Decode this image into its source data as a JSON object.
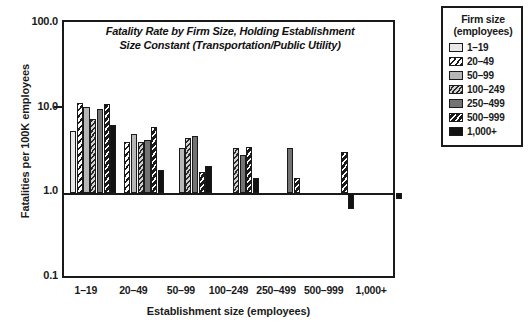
{
  "chart_data": {
    "type": "bar",
    "title": "Fatality Rate by Firm Size, Holding Establishment Size Constant (Transportation/Public Utility)",
    "title_line1": "Fatality Rate by Firm Size, Holding Establishment",
    "title_line2": "Size Constant (Transportation/Public Utility)",
    "xlabel": "Establishment size (employees)",
    "ylabel": "Fatalities per 100K employees",
    "yscale": "log",
    "ylim": [
      0.1,
      100.0
    ],
    "ytick_labels": [
      "100.0",
      "10.0",
      "1.0",
      "0.1"
    ],
    "ytick_values": [
      100.0,
      10.0,
      1.0,
      0.1
    ],
    "grid": false,
    "legend_position": "right-outside",
    "legend_title_line1": "Firm size",
    "legend_title_line2": "(employees)",
    "categories": [
      "1–19",
      "20–49",
      "50–99",
      "100–249",
      "250–499",
      "500–999",
      "1,000+"
    ],
    "series": [
      {
        "name": "1–19",
        "values": [
          5.5,
          null,
          null,
          null,
          null,
          null,
          null
        ]
      },
      {
        "name": "20–49",
        "values": [
          11.7,
          4.0,
          null,
          null,
          null,
          null,
          null
        ]
      },
      {
        "name": "50–99",
        "values": [
          10.5,
          5.0,
          3.4,
          null,
          null,
          null,
          null
        ]
      },
      {
        "name": "100–249",
        "values": [
          7.5,
          4.0,
          4.5,
          3.4,
          null,
          null,
          null
        ]
      },
      {
        "name": "250–499",
        "values": [
          10.0,
          4.3,
          4.7,
          2.8,
          3.4,
          null,
          null
        ]
      },
      {
        "name": "500–999",
        "values": [
          11.5,
          6.0,
          1.8,
          3.5,
          1.5,
          3.1,
          null
        ]
      },
      {
        "name": "1,000+",
        "values": [
          6.5,
          1.9,
          2.1,
          1.5,
          null,
          0.65,
          0.85
        ]
      }
    ]
  },
  "legend": {
    "title_line1": "Firm size",
    "title_line2": "(employees)",
    "items": [
      {
        "label": "1–19"
      },
      {
        "label": "20–49"
      },
      {
        "label": "50–99"
      },
      {
        "label": "100–249"
      },
      {
        "label": "250–499"
      },
      {
        "label": "500–999"
      },
      {
        "label": "1,000+"
      }
    ]
  }
}
